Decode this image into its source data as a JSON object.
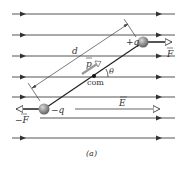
{
  "figure": {
    "caption": "(a)",
    "field_lines_y": [
      14,
      35,
      56,
      77,
      97,
      118,
      138
    ],
    "colors": {
      "field_line": "#555555",
      "arrowhead": "#333333",
      "charge_ball": "#8a8a8a",
      "dipole_line": "#222222",
      "text": "#333333"
    }
  },
  "labels": {
    "positive_charge": "+q",
    "negative_charge": "−q",
    "force_positive": "F",
    "force_negative": "−F",
    "field": "E",
    "dipole_moment": "p",
    "separation": "d",
    "angle": "θ",
    "center_of_mass": "com"
  }
}
